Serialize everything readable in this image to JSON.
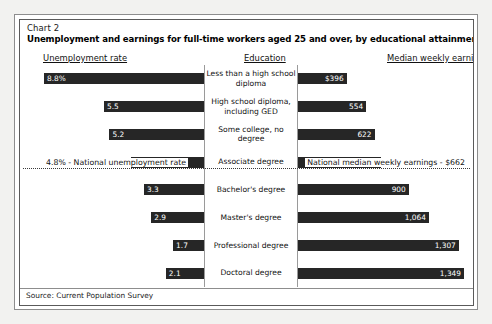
{
  "chart": {
    "number": "Chart 2",
    "title": "Unemployment and earnings for full-time workers aged 25 and over, by educational attainment, 2003",
    "headers": {
      "left": "Unemployment rate",
      "center": "Education",
      "right": "Median weekly earnings"
    },
    "reference": {
      "left_label": "4.8% - National unemployment rate",
      "right_label": "National median weekly earnings - $662"
    },
    "source": "Source: Current Population Survey"
  },
  "chart_data": {
    "type": "bar",
    "title": "Unemployment and earnings for full-time workers aged 25 and over, by educational attainment, 2003",
    "subtitle": "Chart 2",
    "orientation": "horizontal-diverging",
    "categories": [
      "Less than a high school diploma",
      "High school diploma, including GED",
      "Some college, no degree",
      "Associate degree",
      "Bachelor's degree",
      "Master's degree",
      "Professional degree",
      "Doctoral degree"
    ],
    "series": [
      {
        "name": "Unemployment rate",
        "unit": "percent",
        "direction": "left",
        "values": [
          8.8,
          5.5,
          5.2,
          4.0,
          3.3,
          2.9,
          1.7,
          2.1
        ],
        "labels": [
          "8.8%",
          "5.5",
          "5.2",
          "4.0",
          "3.3",
          "2.9",
          "1.7",
          "2.1"
        ],
        "max": 8.8
      },
      {
        "name": "Median weekly earnings",
        "unit": "US dollars",
        "direction": "right",
        "values": [
          396,
          554,
          622,
          672,
          900,
          1064,
          1307,
          1349
        ],
        "labels": [
          "$396",
          "554",
          "622",
          "672",
          "900",
          "1,064",
          "1,307",
          "1,349"
        ],
        "max": 1349
      }
    ],
    "reference_lines": [
      {
        "series": "Unemployment rate",
        "value": 4.8,
        "label": "4.8% - National unemployment rate"
      },
      {
        "series": "Median weekly earnings",
        "value": 662,
        "label": "National median weekly earnings - $662"
      }
    ],
    "xlabel": "",
    "ylabel": "Education",
    "grid": false,
    "legend": "none",
    "source": "Source: Current Population Survey"
  },
  "style": {
    "bar_color": "#262626",
    "bar_label_color": "#ffffff",
    "frame_color": "#5a5a5a",
    "reference_line_color": "#3a3a3a"
  }
}
